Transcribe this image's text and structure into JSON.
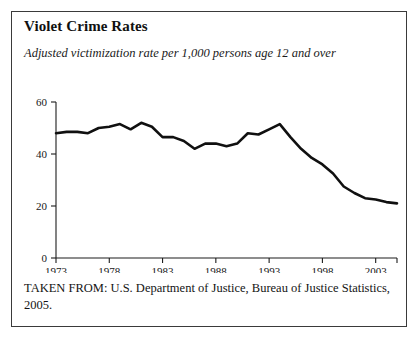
{
  "figure": {
    "title": "Violet Crime Rates",
    "subtitle": "Adjusted victimization rate per 1,000 persons age 12 and over",
    "source": "TAKEN FROM: U.S. Department of Justice, Bureau of Justice Statistics, 2005."
  },
  "chart_data": {
    "type": "line",
    "title": "Violet Crime Rates",
    "subtitle": "Adjusted victimization rate per 1,000 persons age 12 and over",
    "xlabel": "",
    "ylabel": "",
    "xlim": [
      1973,
      2005
    ],
    "ylim": [
      0,
      60
    ],
    "grid": false,
    "legend": "none",
    "x_tick_labels": [
      "1973",
      "1978",
      "1983",
      "1988",
      "1993",
      "1998",
      "2003"
    ],
    "x_tick_values": [
      1973,
      1978,
      1983,
      1988,
      1993,
      1998,
      2003
    ],
    "y_tick_labels": [
      "0",
      "20",
      "40",
      "60"
    ],
    "y_tick_values": [
      0,
      20,
      40,
      60
    ],
    "x": [
      1973,
      1974,
      1975,
      1976,
      1977,
      1978,
      1979,
      1980,
      1981,
      1982,
      1983,
      1984,
      1985,
      1986,
      1987,
      1988,
      1989,
      1990,
      1991,
      1992,
      1993,
      1994,
      1995,
      1996,
      1997,
      1998,
      1999,
      2000,
      2001,
      2002,
      2003,
      2004,
      2005
    ],
    "series": [
      {
        "name": "Adjusted victimization rate",
        "color": "#101010",
        "values": [
          48,
          48.5,
          48.5,
          48,
          50,
          50.5,
          51.5,
          49.5,
          52,
          50.5,
          46.5,
          46.5,
          45,
          42,
          44,
          44,
          43,
          44,
          48,
          47.5,
          49.5,
          51.5,
          46.5,
          42,
          38.5,
          36,
          32.5,
          27.5,
          25,
          23,
          22.5,
          21.5,
          21
        ]
      }
    ],
    "annotations": []
  }
}
